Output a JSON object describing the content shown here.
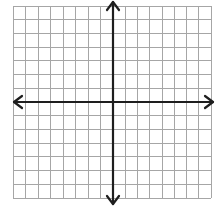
{
  "diagram": {
    "type": "coordinate-plane",
    "grid": {
      "columns": 16,
      "rows": 14,
      "columns_left_of_y_axis": 8,
      "columns_right_of_y_axis": 8,
      "rows_above_x_axis": 7,
      "rows_below_x_axis": 7,
      "line_color": "#a6a6a6",
      "border_color": "#a6a6a6"
    },
    "axes": {
      "color": "#1e1e1e",
      "x_axis": {
        "arrows": [
          "left",
          "right"
        ]
      },
      "y_axis": {
        "arrows": [
          "up",
          "down"
        ]
      }
    },
    "labels": []
  }
}
